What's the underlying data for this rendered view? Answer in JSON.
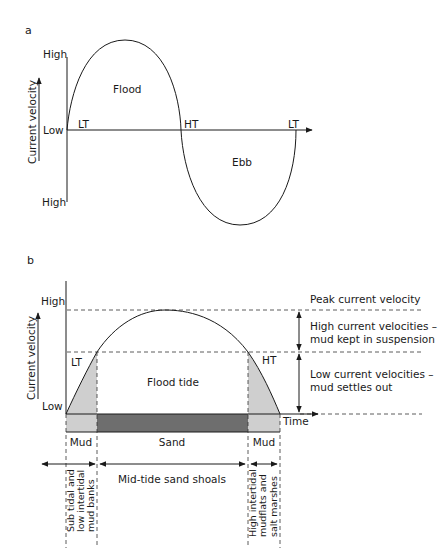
{
  "panel_a": {
    "label": "a",
    "y_axis_title": "Current velocity",
    "y_top": "High",
    "y_mid": "Low",
    "y_bottom": "High",
    "x_marks": [
      "LT",
      "HT",
      "LT"
    ],
    "flood_label": "Flood",
    "ebb_label": "Ebb"
  },
  "panel_b": {
    "label": "b",
    "y_axis_title": "Current velocity",
    "y_top": "High",
    "y_bottom": "Low",
    "x_axis_title": "Time",
    "lt_label": "LT",
    "ht_label": "HT",
    "center_label": "Flood tide",
    "right_annotations": {
      "peak": "Peak current velocity",
      "high_line1": "High current velocities –",
      "high_line2": "mud kept in suspension",
      "low_line1": "Low current velocities –",
      "low_line2": "mud settles out"
    },
    "sediment_bar": [
      "Mud",
      "Sand",
      "Mud"
    ],
    "zones": {
      "left_line1": "Sub tidal and",
      "left_line2": "low intertidal",
      "left_line3": "mud banks",
      "middle": "Mid-tide sand shoals",
      "right_line1": "High intertidal",
      "right_line2": "mudflats and",
      "right_line3": "salt marshes"
    },
    "colors": {
      "mud_fill": "#cfcfcf",
      "sand_fill": "#6e6e6e",
      "line": "#1a1a1a"
    }
  }
}
